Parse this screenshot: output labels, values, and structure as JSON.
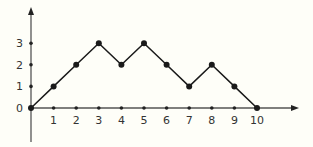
{
  "chart_data": {
    "type": "line",
    "title": "",
    "xlabel": "",
    "ylabel": "",
    "x": [
      0,
      1,
      2,
      3,
      4,
      5,
      6,
      7,
      8,
      9,
      10
    ],
    "series": [
      {
        "name": "path",
        "values": [
          0,
          1,
          2,
          3,
          2,
          3,
          2,
          1,
          2,
          1,
          0
        ]
      }
    ],
    "x_ticks": [
      "1",
      "2",
      "3",
      "4",
      "5",
      "6",
      "7",
      "8",
      "9",
      "10"
    ],
    "y_ticks": [
      "0",
      "1",
      "2",
      "3"
    ],
    "xlim": [
      0,
      10
    ],
    "ylim": [
      0,
      3
    ],
    "grid": false,
    "legend": false,
    "colors": {
      "line": "#1a1a1a",
      "axis": "#555555",
      "background": "#fefef8"
    }
  }
}
